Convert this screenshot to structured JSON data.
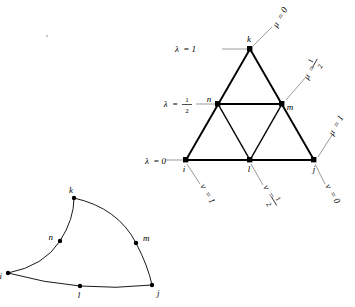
{
  "figure": {
    "title": "",
    "left_element": {
      "name": "curved-triangular-element",
      "nodes": [
        {
          "id": "i",
          "label": "i",
          "x": 8,
          "y": 273,
          "label_dx": -7,
          "label_dy": 4
        },
        {
          "id": "j",
          "label": "j",
          "x": 152,
          "y": 285,
          "label_dx": 4,
          "label_dy": 9
        },
        {
          "id": "k",
          "label": "k",
          "x": 74,
          "y": 198,
          "label_dx": -4,
          "label_dy": -5
        },
        {
          "id": "l",
          "label": "l",
          "x": 80,
          "y": 286,
          "label_dx": -1,
          "label_dy": 11
        },
        {
          "id": "m",
          "label": "m",
          "x": 136,
          "y": 243,
          "label_dx": 5,
          "label_dy": -3
        },
        {
          "id": "n",
          "label": "n",
          "x": 60,
          "y": 241,
          "label_dx": -8,
          "label_dy": -2
        }
      ]
    },
    "right_element": {
      "name": "reference-triangle",
      "nodes": [
        {
          "id": "i",
          "label": "i",
          "x": 186,
          "y": 160,
          "label_dx": -2,
          "label_dy": 10
        },
        {
          "id": "j",
          "label": "j",
          "x": 314,
          "y": 160,
          "label_dx": -1,
          "label_dy": 10
        },
        {
          "id": "k",
          "label": "k",
          "x": 250,
          "y": 49,
          "label_dx": -2,
          "label_dy": -4
        },
        {
          "id": "l",
          "label": "l",
          "x": 250,
          "y": 160,
          "label_dx": -2,
          "label_dy": 10
        },
        {
          "id": "m",
          "label": "m",
          "x": 282,
          "y": 104,
          "label_dx": 5,
          "label_dy": 4
        },
        {
          "id": "n",
          "label": "n",
          "x": 218,
          "y": 104,
          "label_dx": -10,
          "label_dy": 1
        }
      ],
      "lambda_labels": [
        {
          "text": "λ = 1",
          "sym": "λ",
          "val": "1",
          "frac": false,
          "x": 196,
          "y": 48,
          "tick_to_x": 247,
          "tick_to_y": 49
        },
        {
          "text": "λ = ½",
          "sym": "λ",
          "val": "1/2",
          "frac": true,
          "x": 192,
          "y": 104,
          "tick_to_x": 215,
          "tick_to_y": 104
        },
        {
          "text": "λ = 0",
          "sym": "λ",
          "val": "0",
          "frac": false,
          "x": 141,
          "y": 160,
          "tick_to_x": 183,
          "tick_to_y": 160
        }
      ],
      "mu_labels": [
        {
          "text": "μ = 0",
          "sym": "μ",
          "val": "0",
          "frac": false,
          "rot": -60,
          "x": 277,
          "y": 28
        },
        {
          "text": "μ = ½",
          "sym": "μ",
          "val": "1/2",
          "frac": true,
          "rot": -60,
          "x": 310,
          "y": 80
        },
        {
          "text": "μ = 1",
          "sym": "μ",
          "val": "1",
          "frac": false,
          "rot": -60,
          "x": 334,
          "y": 136
        }
      ],
      "nu_labels": [
        {
          "text": "ν = 1",
          "sym": "ν",
          "val": "1",
          "frac": false,
          "rot": 60,
          "x": 200,
          "y": 188
        },
        {
          "text": "ν = ½",
          "sym": "ν",
          "val": "1/2",
          "frac": true,
          "rot": 60,
          "x": 262,
          "y": 190
        },
        {
          "text": "ν = 0",
          "sym": "ν",
          "val": "0",
          "frac": false,
          "rot": 60,
          "x": 322,
          "y": 188
        }
      ]
    }
  },
  "colors": {
    "stroke": "#000000",
    "tick": "#808080",
    "background": "#ffffff"
  }
}
